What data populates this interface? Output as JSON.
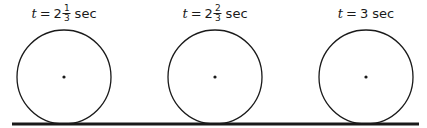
{
  "figure": {
    "colors": {
      "stroke": "#1a1a1a",
      "background": "#ffffff"
    },
    "ground_line": {
      "x1": 12,
      "x2": 419,
      "y": 124,
      "thickness": 3
    },
    "wheels": [
      {
        "label": {
          "var": "t",
          "eq": "=",
          "whole": "2",
          "num": "1",
          "den": "3",
          "unit": "sec"
        },
        "cx": 64,
        "cy": 77,
        "r": 47
      },
      {
        "label": {
          "var": "t",
          "eq": "=",
          "whole": "2",
          "num": "2",
          "den": "3",
          "unit": "sec"
        },
        "cx": 215,
        "cy": 77,
        "r": 47
      },
      {
        "label": {
          "var": "t",
          "eq": "=",
          "whole": "3",
          "num": "",
          "den": "",
          "unit": "sec"
        },
        "cx": 366,
        "cy": 77,
        "r": 47
      }
    ]
  }
}
